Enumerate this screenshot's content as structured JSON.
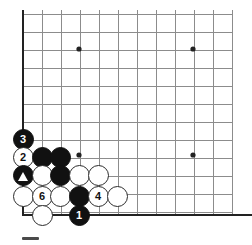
{
  "diagram": {
    "type": "go-board-corner-diagram",
    "board_size": 19,
    "region": "bottom-left corner",
    "background_color": "#ffffff",
    "line_color": "#8c8c8c",
    "edge_line_color": "#222222",
    "black_stone_color": "#111111",
    "white_stone_color": "#ffffff",
    "stone_outline_color": "#2b2b2b"
  },
  "geometry": {
    "origin_x": 23,
    "origin_y": 14,
    "step_x": 19.0,
    "step_y": 18.05,
    "cols": 12,
    "rows": 12,
    "left_edge_x": 23,
    "bottom_edge_y": 215,
    "grid_right_x": 232,
    "grid_top_y": 14,
    "edge_thickness": 2.6,
    "inner_thickness": 1
  },
  "star_points": [
    {
      "name": "star-point-upper-left",
      "x": 79,
      "y": 49
    },
    {
      "name": "star-point-upper-right",
      "x": 193,
      "y": 49
    },
    {
      "name": "star-point-lower-left",
      "x": 79,
      "y": 155
    },
    {
      "name": "star-point-lower-right",
      "x": 193,
      "y": 155
    }
  ],
  "stones": [
    {
      "id": "stone-black-3",
      "color": "black",
      "label": "3",
      "mark": "none",
      "x": 23,
      "y": 139,
      "r": 10.5
    },
    {
      "id": "stone-white-2",
      "color": "white",
      "label": "2",
      "mark": "none",
      "x": 23,
      "y": 157,
      "r": 10.5
    },
    {
      "id": "stone-black-a",
      "color": "black",
      "label": "",
      "mark": "none",
      "x": 42,
      "y": 157,
      "r": 10.5
    },
    {
      "id": "stone-black-b",
      "color": "black",
      "label": "",
      "mark": "none",
      "x": 60,
      "y": 157,
      "r": 10.5
    },
    {
      "id": "stone-black-triangle",
      "color": "black",
      "label": "",
      "mark": "triangle",
      "x": 23,
      "y": 175,
      "r": 10.5
    },
    {
      "id": "stone-white-c",
      "color": "white",
      "label": "",
      "mark": "none",
      "x": 42,
      "y": 175,
      "r": 10.5
    },
    {
      "id": "stone-black-d",
      "color": "black",
      "label": "",
      "mark": "none",
      "x": 60,
      "y": 175,
      "r": 10.5
    },
    {
      "id": "stone-white-e",
      "color": "white",
      "label": "",
      "mark": "none",
      "x": 79,
      "y": 175,
      "r": 10.5
    },
    {
      "id": "stone-white-f",
      "color": "white",
      "label": "",
      "mark": "none",
      "x": 98,
      "y": 175,
      "r": 10.5
    },
    {
      "id": "stone-white-g",
      "color": "white",
      "label": "",
      "mark": "none",
      "x": 23,
      "y": 196,
      "r": 10.5
    },
    {
      "id": "stone-white-6",
      "color": "white",
      "label": "6",
      "mark": "none",
      "x": 42,
      "y": 196,
      "r": 10.5
    },
    {
      "id": "stone-white-h",
      "color": "white",
      "label": "",
      "mark": "none",
      "x": 60,
      "y": 196,
      "r": 10.5
    },
    {
      "id": "stone-black-i",
      "color": "black",
      "label": "",
      "mark": "none",
      "x": 79,
      "y": 196,
      "r": 10.5
    },
    {
      "id": "stone-white-4",
      "color": "white",
      "label": "4",
      "mark": "none",
      "x": 98,
      "y": 196,
      "r": 10.5
    },
    {
      "id": "stone-white-j",
      "color": "white",
      "label": "",
      "mark": "none",
      "x": 117,
      "y": 196,
      "r": 10.5
    },
    {
      "id": "stone-white-k",
      "color": "white",
      "label": "",
      "mark": "none",
      "x": 42,
      "y": 215,
      "r": 10.5
    },
    {
      "id": "stone-black-1",
      "color": "black",
      "label": "1",
      "mark": "none",
      "x": 79,
      "y": 215,
      "r": 10.5
    }
  ],
  "scale_bar": {
    "name": "scale-bar",
    "x": 22,
    "y": 237,
    "width": 17,
    "height": 3,
    "color": "#4a4a4a"
  },
  "move_sequence": [
    {
      "number": "1",
      "color": "black"
    },
    {
      "number": "2",
      "color": "white"
    },
    {
      "number": "3",
      "color": "black"
    },
    {
      "number": "4",
      "color": "white"
    },
    {
      "number": "6",
      "color": "white"
    }
  ]
}
